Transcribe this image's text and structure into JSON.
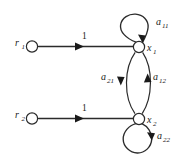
{
  "figure": {
    "type": "signal-flow-graph",
    "background_color": "#ffffff",
    "line_color": "#2b2b2b",
    "text_color": "#1a1a1a"
  },
  "nodes": [
    {
      "id": "r1",
      "label_base": "r",
      "label_sub": "1",
      "label_side": "left",
      "cx": 32,
      "cy": 46,
      "r": 5.6
    },
    {
      "id": "r2",
      "label_base": "r",
      "label_sub": "2",
      "label_side": "left",
      "cx": 32,
      "cy": 118,
      "r": 5.6
    },
    {
      "id": "x1",
      "label_base": "x",
      "label_sub": "1",
      "label_side": "right",
      "cx": 139,
      "cy": 47,
      "r": 5.6
    },
    {
      "id": "x2",
      "label_base": "x",
      "label_sub": "2",
      "label_side": "right",
      "cx": 139,
      "cy": 119,
      "r": 5.6
    }
  ],
  "edges": [
    {
      "id": "r1-x1",
      "from": "r1",
      "to": "x1",
      "weight": "1",
      "kind": "straight"
    },
    {
      "id": "r2-x2",
      "from": "r2",
      "to": "x2",
      "weight": "1",
      "kind": "straight"
    },
    {
      "id": "x1-x1",
      "from": "x1",
      "to": "x1",
      "weight_base": "a",
      "weight_sub": "11",
      "kind": "self-loop-top"
    },
    {
      "id": "x2-x2",
      "from": "x2",
      "to": "x2",
      "weight_base": "a",
      "weight_sub": "22",
      "kind": "self-loop-bottom"
    },
    {
      "id": "x1-x2",
      "from": "x1",
      "to": "x2",
      "weight_base": "a",
      "weight_sub": "21",
      "kind": "arc-left-down"
    },
    {
      "id": "x2-x1",
      "from": "x2",
      "to": "x1",
      "weight_base": "a",
      "weight_sub": "12",
      "kind": "arc-right-up"
    }
  ],
  "labels": {
    "r1": {
      "base": "r",
      "sub": "1"
    },
    "r2": {
      "base": "r",
      "sub": "2"
    },
    "x1": {
      "base": "x",
      "sub": "1"
    },
    "x2": {
      "base": "x",
      "sub": "2"
    },
    "a11": {
      "base": "a",
      "sub": "11"
    },
    "a12": {
      "base": "a",
      "sub": "12"
    },
    "a21": {
      "base": "a",
      "sub": "21"
    },
    "a22": {
      "base": "a",
      "sub": "22"
    },
    "w1_top": "1",
    "w1_bottom": "1"
  }
}
